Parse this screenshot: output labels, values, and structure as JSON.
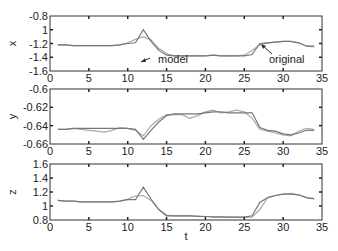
{
  "chart_data": [
    {
      "type": "line",
      "ylabel": "x",
      "xlabel": "",
      "xlim": [
        0,
        35
      ],
      "ylim": [
        -1.6,
        -0.8
      ],
      "xticks": [
        "0",
        "5",
        "10",
        "15",
        "20",
        "25",
        "30",
        "35"
      ],
      "yticks": [
        "-0.8",
        "1",
        "-1.2",
        "-1.4",
        "-1.6"
      ],
      "yticks_values": [
        -0.8,
        -1.0,
        -1.2,
        -1.4,
        -1.6
      ],
      "grid": false,
      "x": [
        1,
        2,
        3,
        4,
        5,
        6,
        7,
        8,
        9,
        10,
        11,
        12,
        13,
        14,
        15,
        16,
        17,
        18,
        19,
        20,
        21,
        22,
        23,
        24,
        25,
        26,
        27,
        28,
        29,
        30,
        31,
        32,
        33,
        34
      ],
      "series": [
        {
          "name": "model",
          "values": [
            -1.22,
            -1.22,
            -1.23,
            -1.23,
            -1.23,
            -1.23,
            -1.23,
            -1.23,
            -1.22,
            -1.2,
            -1.19,
            -1.0,
            -1.17,
            -1.3,
            -1.37,
            -1.38,
            -1.38,
            -1.38,
            -1.38,
            -1.38,
            -1.37,
            -1.38,
            -1.38,
            -1.38,
            -1.38,
            -1.36,
            -1.2,
            -1.19,
            -1.18,
            -1.17,
            -1.17,
            -1.19,
            -1.24,
            -1.24
          ]
        },
        {
          "name": "original",
          "values": [
            -1.22,
            -1.22,
            -1.23,
            -1.23,
            -1.23,
            -1.23,
            -1.23,
            -1.23,
            -1.22,
            -1.19,
            -1.14,
            -1.1,
            -1.15,
            -1.27,
            -1.35,
            -1.38,
            -1.38,
            -1.38,
            -1.38,
            -1.38,
            -1.37,
            -1.38,
            -1.38,
            -1.38,
            -1.37,
            -1.3,
            -1.22,
            -1.19,
            -1.18,
            -1.17,
            -1.17,
            -1.19,
            -1.24,
            -1.25
          ]
        }
      ],
      "annotations": [
        {
          "text": "model",
          "arrow_to": [
            12,
            -1.1
          ]
        },
        {
          "text": "original",
          "arrow_to": [
            27,
            -1.22
          ]
        }
      ]
    },
    {
      "type": "line",
      "ylabel": "y",
      "xlabel": "",
      "xlim": [
        0,
        35
      ],
      "ylim": [
        -0.66,
        -0.6
      ],
      "xticks": [
        "0",
        "5",
        "10",
        "15",
        "20",
        "25",
        "30",
        "35"
      ],
      "yticks": [
        "-0.6",
        "-0.62",
        "-0.64",
        "-0.66"
      ],
      "yticks_values": [
        -0.6,
        -0.62,
        -0.64,
        -0.66
      ],
      "grid": false,
      "x": [
        1,
        2,
        3,
        4,
        5,
        6,
        7,
        8,
        9,
        10,
        11,
        12,
        13,
        14,
        15,
        16,
        17,
        18,
        19,
        20,
        21,
        22,
        23,
        24,
        25,
        26,
        27,
        28,
        29,
        30,
        31,
        32,
        33,
        34
      ],
      "series": [
        {
          "name": "model",
          "values": [
            -0.644,
            -0.644,
            -0.643,
            -0.643,
            -0.643,
            -0.643,
            -0.643,
            -0.643,
            -0.643,
            -0.643,
            -0.644,
            -0.655,
            -0.645,
            -0.636,
            -0.629,
            -0.627,
            -0.627,
            -0.627,
            -0.627,
            -0.626,
            -0.625,
            -0.625,
            -0.626,
            -0.626,
            -0.626,
            -0.626,
            -0.642,
            -0.645,
            -0.646,
            -0.649,
            -0.65,
            -0.648,
            -0.645,
            -0.645
          ]
        },
        {
          "name": "original",
          "values": [
            -0.644,
            -0.644,
            -0.643,
            -0.644,
            -0.645,
            -0.646,
            -0.647,
            -0.645,
            -0.642,
            -0.643,
            -0.645,
            -0.651,
            -0.64,
            -0.633,
            -0.628,
            -0.628,
            -0.628,
            -0.632,
            -0.629,
            -0.625,
            -0.623,
            -0.626,
            -0.625,
            -0.623,
            -0.625,
            -0.632,
            -0.644,
            -0.646,
            -0.648,
            -0.65,
            -0.651,
            -0.646,
            -0.643,
            -0.644
          ]
        }
      ]
    },
    {
      "type": "line",
      "ylabel": "z",
      "xlabel": "t",
      "xlim": [
        0,
        35
      ],
      "ylim": [
        0.8,
        1.6
      ],
      "xticks": [
        "0",
        "5",
        "10",
        "15",
        "20",
        "25",
        "30",
        "35"
      ],
      "yticks": [
        "1.6",
        "1.4",
        "1.2",
        "1",
        "0.8"
      ],
      "yticks_values": [
        1.6,
        1.4,
        1.2,
        1.0,
        0.8
      ],
      "grid": false,
      "x": [
        1,
        2,
        3,
        4,
        5,
        6,
        7,
        8,
        9,
        10,
        11,
        12,
        13,
        14,
        15,
        16,
        17,
        18,
        19,
        20,
        21,
        22,
        23,
        24,
        25,
        26,
        27,
        28,
        29,
        30,
        31,
        32,
        33,
        34
      ],
      "series": [
        {
          "name": "model",
          "values": [
            1.08,
            1.07,
            1.07,
            1.06,
            1.06,
            1.06,
            1.06,
            1.06,
            1.07,
            1.09,
            1.09,
            1.27,
            1.1,
            0.95,
            0.86,
            0.86,
            0.86,
            0.86,
            0.85,
            0.85,
            0.84,
            0.84,
            0.84,
            0.84,
            0.84,
            0.86,
            1.05,
            1.12,
            1.15,
            1.17,
            1.17,
            1.16,
            1.12,
            1.1
          ]
        },
        {
          "name": "original",
          "values": [
            1.08,
            1.07,
            1.07,
            1.06,
            1.06,
            1.06,
            1.06,
            1.06,
            1.07,
            1.1,
            1.14,
            1.15,
            1.08,
            0.95,
            0.87,
            0.86,
            0.86,
            0.86,
            0.86,
            0.85,
            0.85,
            0.85,
            0.84,
            0.84,
            0.84,
            0.84,
            0.95,
            1.12,
            1.15,
            1.17,
            1.18,
            1.16,
            1.12,
            1.11
          ]
        }
      ]
    }
  ],
  "labels": {
    "model": "model",
    "original": "original",
    "xlabel": "t",
    "ylabel_x": "x",
    "ylabel_y": "y",
    "ylabel_z": "z"
  },
  "colors": {
    "model": "#777777",
    "original": "#aaaaaa",
    "axis": "#333333"
  }
}
